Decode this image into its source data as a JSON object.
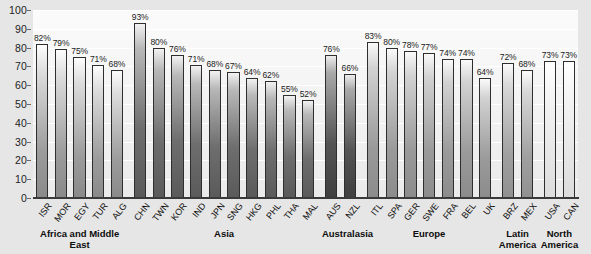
{
  "chart_data": {
    "type": "bar",
    "title": "",
    "subtitle": "",
    "xlabel": "",
    "ylabel": "",
    "ylim": [
      0,
      100
    ],
    "yticks": [
      0,
      10,
      20,
      30,
      40,
      50,
      60,
      70,
      80,
      90,
      100
    ],
    "grid": true,
    "legend": "none",
    "value_suffix": "%",
    "categories": [
      "ISR",
      "MOR",
      "EGY",
      "TUR",
      "ALG",
      "CHN",
      "TWN",
      "KOR",
      "IND",
      "JPN",
      "SNG",
      "HKG",
      "PHL",
      "THA",
      "MAL",
      "AUS",
      "NZL",
      "ITL",
      "SPA",
      "GER",
      "SWE",
      "FRA",
      "BEL",
      "UK",
      "BRZ",
      "MEX",
      "USA",
      "CAN"
    ],
    "values": [
      82,
      79,
      75,
      71,
      68,
      93,
      80,
      76,
      71,
      68,
      67,
      64,
      62,
      55,
      52,
      76,
      66,
      83,
      80,
      78,
      77,
      74,
      74,
      64,
      72,
      68,
      73,
      73
    ],
    "value_labels": [
      "82%",
      "79%",
      "75%",
      "71%",
      "68%",
      "93%",
      "80%",
      "76%",
      "71%",
      "68%",
      "67%",
      "64%",
      "62%",
      "55%",
      "52%",
      "76%",
      "66%",
      "83%",
      "80%",
      "78%",
      "77%",
      "74%",
      "74%",
      "64%",
      "72%",
      "68%",
      "73%",
      "73%"
    ],
    "groups": [
      {
        "label": "Africa and Middle East",
        "start": 0,
        "count": 5,
        "shade": "g-a"
      },
      {
        "label": "Asia",
        "start": 5,
        "count": 10,
        "shade": "g-b"
      },
      {
        "label": "Australasia",
        "start": 15,
        "count": 2,
        "shade": "g-c"
      },
      {
        "label": "Europe",
        "start": 17,
        "count": 7,
        "shade": "g-d"
      },
      {
        "label": "Latin\nAmerica",
        "start": 24,
        "count": 2,
        "shade": "g-e"
      },
      {
        "label": "North\nAmerica",
        "start": 26,
        "count": 2,
        "shade": "g-f"
      }
    ],
    "group_labels": [
      "Africa and Middle East",
      "Asia",
      "Australasia",
      "Europe",
      "Latin America",
      "North America"
    ]
  },
  "colors": {
    "page_background": "#e6e6e6",
    "plot_background": "#f6f6f6",
    "gridline": "#ffffff",
    "axis": "#3a3a3a",
    "bar_outline": "#2e2e2e",
    "text": "#111111"
  }
}
